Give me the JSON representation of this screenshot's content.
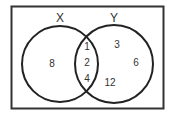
{
  "diagram": {
    "type": "venn",
    "sets": [
      {
        "label": "X",
        "only": [
          "8"
        ]
      },
      {
        "label": "Y",
        "only": [
          "3",
          "6",
          "12"
        ]
      }
    ],
    "intersection": [
      "1",
      "2",
      "4"
    ],
    "colors": {
      "stroke": "#222222",
      "text": "#333333",
      "background": "#ffffff"
    }
  }
}
